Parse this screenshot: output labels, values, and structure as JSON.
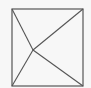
{
  "diagram": {
    "type": "geometry",
    "background": "#f7f7f7",
    "stroke_color": "#555555",
    "square": {
      "x1": 12,
      "y1": 9,
      "x2": 83,
      "y2": 86
    },
    "vertices": {
      "top_left": [
        12,
        9
      ],
      "top_right": [
        83,
        9
      ],
      "bottom_left": [
        12,
        86
      ],
      "bottom_right": [
        83,
        86
      ]
    },
    "interior_point": [
      33,
      50
    ],
    "segments": [
      {
        "from": "top_left",
        "to": "interior_point"
      },
      {
        "from": "top_right",
        "to": "interior_point"
      },
      {
        "from": "bottom_left",
        "to": "interior_point"
      },
      {
        "from": "bottom_right",
        "to": "interior_point"
      }
    ]
  }
}
